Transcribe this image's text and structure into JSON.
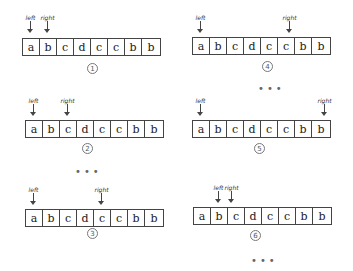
{
  "array": [
    "a",
    "b",
    "c",
    "d",
    "c",
    "c",
    "b",
    "b"
  ],
  "labels": {
    "left": "left",
    "right": "right"
  },
  "panels": [
    {
      "step": "1",
      "left_index": 0,
      "right_index": 1
    },
    {
      "step": "2",
      "left_index": 0,
      "right_index": 2
    },
    {
      "step": "3",
      "left_index": 0,
      "right_index": 4
    },
    {
      "step": "4",
      "left_index": 0,
      "right_index": 5
    },
    {
      "step": "5",
      "left_index": 0,
      "right_index": 7
    },
    {
      "step": "6",
      "left_index": 1,
      "right_index": 2
    }
  ],
  "ellipsis": "•••"
}
